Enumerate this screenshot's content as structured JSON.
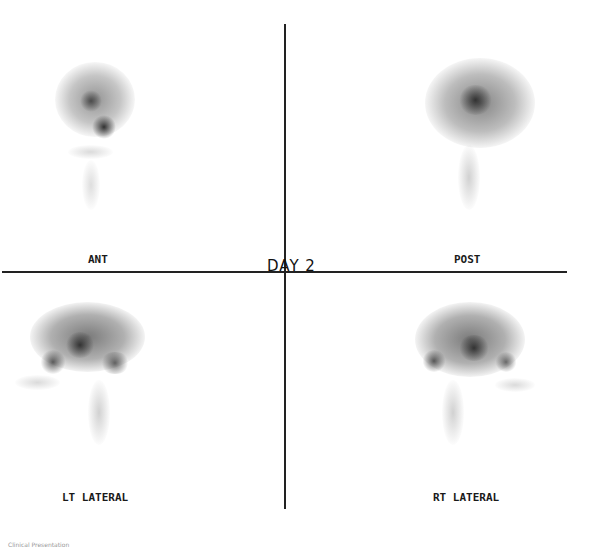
{
  "title": "DAY 2",
  "views": [
    {
      "id": "ant",
      "label": "ANT"
    },
    {
      "id": "post",
      "label": "POST"
    },
    {
      "id": "lt-lateral",
      "label": "LT LATERAL"
    },
    {
      "id": "rt-lateral",
      "label": "RT LATERAL"
    }
  ],
  "footer": "Clinical Presentation",
  "colors": {
    "line": "#222222",
    "uptake": "#333333",
    "background": "#ffffff"
  }
}
